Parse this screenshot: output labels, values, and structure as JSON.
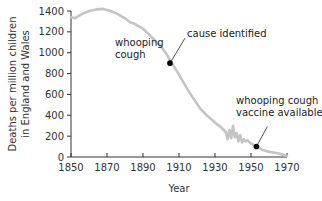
{
  "chart_data": {
    "type": "line",
    "title": "",
    "xlabel": "Year",
    "ylabel_lines": [
      "Deaths per million children",
      "in England and Wales"
    ],
    "xlim": [
      1850,
      1970
    ],
    "ylim": [
      0,
      1400
    ],
    "xticks": [
      1850,
      1870,
      1890,
      1910,
      1930,
      1950,
      1970
    ],
    "yticks": [
      0,
      200,
      400,
      600,
      800,
      1000,
      1200,
      1400
    ],
    "grid": false,
    "line_color": "#c4c4c4",
    "series": [
      {
        "name": "whooping cough",
        "x": [
          1850,
          1852,
          1856,
          1860,
          1864,
          1868,
          1872,
          1876,
          1880,
          1883,
          1885,
          1888,
          1890,
          1893,
          1896,
          1900,
          1903,
          1906,
          1910,
          1914,
          1918,
          1922,
          1926,
          1930,
          1933,
          1936,
          1937,
          1938,
          1939,
          1940,
          1941,
          1942,
          1943,
          1944,
          1945,
          1946,
          1947,
          1948,
          1950,
          1953,
          1956,
          1960,
          1965,
          1970
        ],
        "y": [
          1340,
          1330,
          1370,
          1400,
          1415,
          1420,
          1400,
          1370,
          1330,
          1290,
          1280,
          1250,
          1230,
          1180,
          1130,
          1060,
          990,
          900,
          790,
          670,
          560,
          460,
          390,
          330,
          290,
          240,
          170,
          260,
          180,
          300,
          190,
          230,
          150,
          210,
          140,
          170,
          150,
          160,
          130,
          100,
          70,
          50,
          35,
          10
        ]
      }
    ],
    "annotations": [
      {
        "text": "whooping",
        "text2": "cough",
        "kind": "series-label"
      },
      {
        "text": "cause identified",
        "x": 1905,
        "y": 900,
        "kind": "marker"
      },
      {
        "text": "whooping cough",
        "text2": "vaccine available",
        "x": 1953,
        "y": 100,
        "kind": "marker"
      }
    ]
  }
}
